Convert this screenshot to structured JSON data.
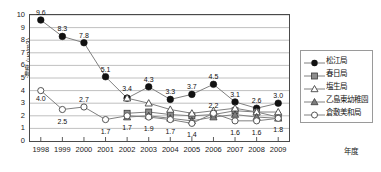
{
  "chart_data": {
    "type": "line",
    "title": "",
    "xlabel": "年度",
    "ylabel": "濃度 (μg/m3)",
    "ylim": [
      0,
      10
    ],
    "yticks": [
      "0",
      "1",
      "2",
      "3",
      "4",
      "5",
      "6",
      "7",
      "8",
      "9",
      "10"
    ],
    "grid": true,
    "legend_position": "right",
    "categories": [
      "1998",
      "1999",
      "2000",
      "2001",
      "2002",
      "2003",
      "2004",
      "2005",
      "2006",
      "2007",
      "2008",
      "2009"
    ],
    "series": [
      {
        "name": "松江局",
        "marker": "filled-circle",
        "values": [
          9.6,
          8.3,
          7.8,
          5.1,
          3.4,
          4.3,
          3.3,
          3.7,
          4.5,
          3.1,
          2.6,
          3.0
        ],
        "labels": [
          "9.6",
          "8.3",
          "7.8",
          "5.1",
          "3.4",
          "4.3",
          "3.3",
          "3.7",
          "4.5",
          "3.1",
          "2.6",
          "3.0"
        ]
      },
      {
        "name": "春日局",
        "marker": "filled-square",
        "values": [
          null,
          null,
          null,
          null,
          2.2,
          2.3,
          2.1,
          2.0,
          2.1,
          2.4,
          2.3,
          1.9
        ]
      },
      {
        "name": "塩生局",
        "marker": "open-triangle",
        "values": [
          null,
          null,
          null,
          null,
          3.4,
          3.0,
          2.5,
          2.2,
          2.4,
          2.6,
          2.3,
          2.3
        ]
      },
      {
        "name": "乙島東幼稚園",
        "marker": "filled-triangle",
        "values": [
          null,
          null,
          null,
          null,
          1.9,
          2.0,
          1.8,
          1.6,
          1.9,
          2.1,
          1.9,
          1.8
        ]
      },
      {
        "name": "倉敷美和局",
        "marker": "open-circle",
        "values": [
          4.0,
          2.5,
          2.7,
          1.7,
          2.0,
          1.9,
          1.7,
          1.4,
          2.2,
          1.6,
          1.6,
          1.8
        ],
        "labels": [
          "4.0",
          "2.5",
          "2.7",
          "1.7",
          "1.7",
          "1.9",
          "1.7",
          "1.4",
          "2.2",
          "1.6",
          "1.6",
          "1.8"
        ]
      }
    ],
    "annotations_upper": [
      {
        "x": "1998",
        "text": "9.6"
      },
      {
        "x": "1999",
        "text": "8.3"
      },
      {
        "x": "2000",
        "text": "7.8"
      },
      {
        "x": "2001",
        "text": "5.1"
      },
      {
        "x": "2002",
        "text": "3.4"
      },
      {
        "x": "2003",
        "text": "4.3"
      },
      {
        "x": "2004",
        "text": "3.3"
      },
      {
        "x": "2005",
        "text": "3.7"
      },
      {
        "x": "2006",
        "text": "4.5"
      },
      {
        "x": "2007",
        "text": "3.1"
      },
      {
        "x": "2008",
        "text": "2.6"
      },
      {
        "x": "2009",
        "text": "3.0"
      }
    ],
    "annotations_lower": [
      {
        "x": "1998",
        "text": "4.0"
      },
      {
        "x": "1999",
        "text": "2.5"
      },
      {
        "x": "2000",
        "text": "2.7"
      },
      {
        "x": "2001",
        "text": "1.7"
      },
      {
        "x": "2002",
        "text": "1.7"
      },
      {
        "x": "2003",
        "text": "1.9"
      },
      {
        "x": "2004",
        "text": "1.7"
      },
      {
        "x": "2005",
        "text": "1.4"
      },
      {
        "x": "2006",
        "text": "2.2"
      },
      {
        "x": "2007",
        "text": "1.6"
      },
      {
        "x": "2008",
        "text": "1.6"
      },
      {
        "x": "2009",
        "text": "1.8"
      }
    ],
    "colors": {
      "series_line": "#808080",
      "filled_marker": "#111111",
      "grid": "#b9b9b9",
      "axis": "#4a4a4a",
      "background": "#ffffff"
    }
  },
  "legend": {
    "items": [
      {
        "label": "松江局",
        "marker": "filled-circle"
      },
      {
        "label": "春日局",
        "marker": "filled-square"
      },
      {
        "label": "塩生局",
        "marker": "open-triangle"
      },
      {
        "label": "乙島東幼稚園",
        "marker": "filled-triangle"
      },
      {
        "label": "倉敷美和局",
        "marker": "open-circle"
      }
    ]
  }
}
